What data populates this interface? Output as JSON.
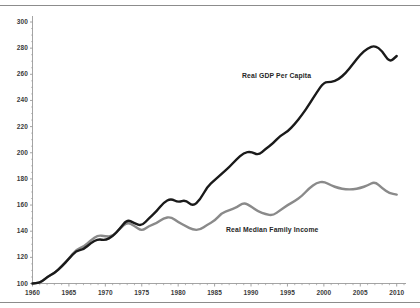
{
  "figure": {
    "background_color": "#ffffff",
    "frame_rule_color": "#8c8c8c",
    "axis_color": "#9a9a9a",
    "tick_label_color": "#3a3a3a"
  },
  "chart_data": {
    "type": "line",
    "title": "",
    "subtitle": "",
    "xlabel": "",
    "ylabel": "",
    "grid": false,
    "legend_position": "inline-annotation",
    "xlim": [
      1960,
      2011
    ],
    "ylim": [
      100,
      300
    ],
    "x_tick_labels": [
      "1960",
      "1965",
      "1970",
      "1975",
      "1980",
      "1985",
      "1990",
      "1995",
      "2000",
      "2005",
      "2010"
    ],
    "x_tick_values": [
      1960,
      1965,
      1970,
      1975,
      1980,
      1985,
      1990,
      1995,
      2000,
      2005,
      2010
    ],
    "x_minor_tick_step": 1,
    "y_tick_labels": [
      "100",
      "120",
      "140",
      "160",
      "180",
      "200",
      "220",
      "240",
      "260",
      "280",
      "300"
    ],
    "y_tick_values": [
      100,
      120,
      140,
      160,
      180,
      200,
      220,
      240,
      260,
      280,
      300
    ],
    "y_minor_tick_step": 5,
    "x": [
      1960,
      1961,
      1962,
      1963,
      1964,
      1965,
      1966,
      1967,
      1968,
      1969,
      1970,
      1971,
      1972,
      1973,
      1974,
      1975,
      1976,
      1977,
      1978,
      1979,
      1980,
      1981,
      1982,
      1983,
      1984,
      1985,
      1986,
      1987,
      1988,
      1989,
      1990,
      1991,
      1992,
      1993,
      1994,
      1995,
      1996,
      1997,
      1998,
      1999,
      2000,
      2001,
      2002,
      2003,
      2004,
      2005,
      2006,
      2007,
      2008,
      2009,
      2010
    ],
    "series": [
      {
        "name": "Real GDP Per Capita",
        "color": "#1a1a1a",
        "line_width": 2.4,
        "values": [
          100,
          100,
          105,
          108,
          113,
          119,
          125,
          126,
          131,
          134,
          133,
          136,
          142,
          149,
          146,
          144,
          150,
          155,
          162,
          165,
          162,
          164,
          159,
          164,
          174,
          179,
          184,
          189,
          195,
          200,
          201,
          198,
          203,
          207,
          213,
          216,
          222,
          229,
          237,
          246,
          254,
          254,
          256,
          261,
          268,
          275,
          280,
          282,
          278,
          269,
          274
        ]
      },
      {
        "name": "Real Median Family Income",
        "color": "#8a8a8a",
        "line_width": 2.4,
        "values": [
          100,
          100,
          105,
          108,
          113,
          119,
          126,
          128,
          133,
          137,
          136,
          136,
          142,
          147,
          144,
          140,
          144,
          146,
          150,
          151,
          147,
          144,
          141,
          141,
          145,
          148,
          154,
          156,
          158,
          162,
          159,
          155,
          153,
          152,
          156,
          160,
          163,
          167,
          173,
          177,
          178,
          175,
          173,
          172,
          172,
          173,
          175,
          178,
          173,
          169,
          168
        ]
      }
    ]
  }
}
